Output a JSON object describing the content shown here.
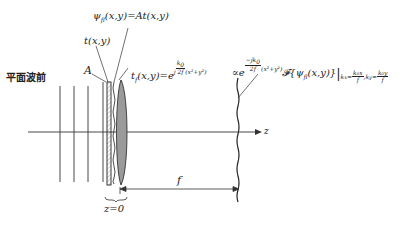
{
  "diagram": {
    "type": "optical-setup",
    "title_label": "平面波前",
    "labels": {
      "amplitude": "A",
      "transmittance": "t(x,y)",
      "psi_field": "ψ_fl(x,y)=At(x,y)",
      "psi_lhs": "ψ",
      "psi_sub": "fl",
      "psi_rhs": "(x,y)=At(x,y)",
      "lens_tf": "t_f(x,y)=e^{j k0/(2f) (x²+y²)}",
      "lens_t": "t",
      "lens_sub": "f",
      "lens_mid": "(x,y)=e",
      "lens_j": "j",
      "lens_num": "k",
      "lens_num_sub": "0",
      "lens_den": "2f",
      "lens_tail": "(x²+y²)",
      "output_field": "∝e^{-j k0/(2f) (x²+y²)} F{ψ_fl(x,y)} |_{kx=k0x/f, ky=k0y/f}",
      "out_prop": "∝e",
      "out_num": "−jk",
      "out_num_sub": "0",
      "out_den": "2f",
      "out_tail": "(x²+y²)",
      "out_F": "𝓕{ψ",
      "out_psi_sub": "fl",
      "out_args": "(x,y)}",
      "out_eval_kx": "k",
      "out_eval_kx_sub": "x",
      "out_eval_eq": "=",
      "out_eval_kx_num": "k₀x",
      "out_eval_kx_den": "f",
      "out_eval_ky": ",k",
      "out_eval_ky_sub": "y",
      "out_eval_ky_num": "k₀y",
      "out_eval_ky_den": "f",
      "axis": "z",
      "focal_length": "f",
      "origin": "z=0"
    },
    "elements": [
      {
        "name": "plane-wavefront-lines",
        "count": 4
      },
      {
        "name": "transparency",
        "position": "z=0",
        "style": "hatched rectangle"
      },
      {
        "name": "thin-lens",
        "style": "gray filled biconvex"
      },
      {
        "name": "focal-plane",
        "style": "wavy vertical line",
        "distance": "f"
      }
    ]
  }
}
